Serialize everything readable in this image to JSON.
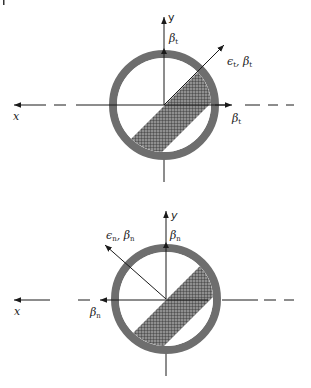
{
  "figure": {
    "panels": [
      {
        "id": "top",
        "description": "Tangential direction loading",
        "center": [
          164,
          105
        ],
        "labels": {
          "x_axis": "x",
          "y_axis": "y",
          "y_beta": "β",
          "y_beta_sub": "t",
          "diag_label": "ϵ",
          "diag_label_sub": "t",
          "diag_sep": ", ",
          "diag_beta": "β",
          "diag_beta_sub": "t",
          "x_beta": "β",
          "x_beta_sub": "t"
        }
      },
      {
        "id": "bottom",
        "description": "Normal direction loading",
        "center": [
          166,
          299
        ],
        "labels": {
          "x_axis": "x",
          "y_axis": "y",
          "y_beta": "β",
          "y_beta_sub": "n",
          "diag_label": "ϵ",
          "diag_label_sub": "n",
          "diag_sep": ", ",
          "diag_beta": "β",
          "diag_beta_sub": "n",
          "x_beta": "β",
          "x_beta_sub": "n"
        }
      }
    ],
    "colors": {
      "ring": "#6e6e6e",
      "hatch_bg": "#9a9a9a",
      "hatch_line": "#3a3a3a",
      "axis": "#1a1a1a"
    }
  }
}
